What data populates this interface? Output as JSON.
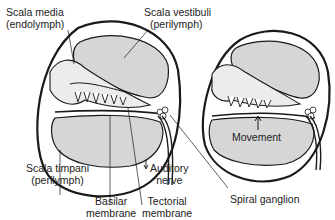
{
  "diagram": {
    "colors": {
      "fill_gray": "#d6d6d6",
      "fill_light": "#ececec",
      "stroke": "#1a1a1a"
    },
    "left_panel": {
      "labels": {
        "scala_media": "Scala media",
        "scala_media_sub": "(endolymph)",
        "scala_vestibuli": "Scala vestibuli",
        "scala_vestibuli_sub": "(perilymph)",
        "scala_timpani": "Scala timpani",
        "scala_timpani_sub": "(perilymph)",
        "basilar": "Basilar",
        "basilar_sub": "membrane",
        "tectorial": "Tectorial",
        "tectorial_sub": "membrane",
        "auditory": "Auditory",
        "auditory_sub": "nerve",
        "spiral_ganglion": "Spiral ganglion"
      }
    },
    "right_panel": {
      "labels": {
        "movement": "Movement"
      }
    }
  }
}
